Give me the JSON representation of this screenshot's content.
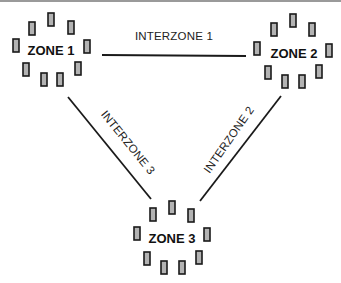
{
  "zones": [
    {
      "label": "ZONE 1",
      "center": [
        50,
        46
      ]
    },
    {
      "label": "ZONE 2",
      "center": [
        291,
        52
      ]
    },
    {
      "label": "ZONE 3",
      "center": [
        171,
        238
      ]
    }
  ],
  "interzones": [
    {
      "label": "INTERZONE 1",
      "from": "ZONE 1",
      "to": "ZONE 2"
    },
    {
      "label": "INTERZONE 2",
      "from": "ZONE 2",
      "to": "ZONE 3"
    },
    {
      "label": "INTERZONE 3",
      "from": "ZONE 1",
      "to": "ZONE 3"
    }
  ],
  "nodes_per_zone": 9,
  "colors": {
    "node_fill": "#b3b3b3",
    "node_stroke": "#1a1a1a",
    "line": "#1a1a1a",
    "background": "#ffffff"
  }
}
